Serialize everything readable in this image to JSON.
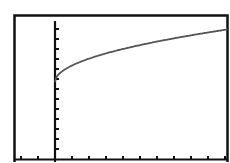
{
  "chart_data": {
    "type": "line",
    "title": "",
    "xlabel": "",
    "ylabel": "",
    "grid": false,
    "legend": null,
    "xlim": [
      -2,
      10.3
    ],
    "ylim": [
      0,
      13.7
    ],
    "x_tick_step": 1,
    "y_tick_step": 1,
    "series": [
      {
        "name": "f(x)",
        "color": "#555555",
        "x": [
          0,
          0.5,
          1,
          2,
          3,
          4,
          5,
          6,
          7,
          8,
          9,
          10
        ],
        "y": [
          7.7,
          8.87,
          9.35,
          10.03,
          10.56,
          11.0,
          11.39,
          11.74,
          12.07,
          12.37,
          12.65,
          12.92
        ]
      }
    ]
  },
  "colors": {
    "background": "#ffffff",
    "frame": "#111111",
    "axes": "#111111",
    "curve": "#555555"
  }
}
